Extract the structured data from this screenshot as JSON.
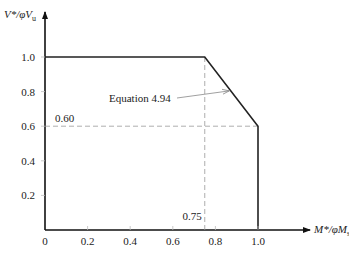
{
  "chart_data": {
    "type": "line",
    "title": "",
    "xlabel": "M*/φMₛ",
    "ylabel": "V*/φVᵤ",
    "xlabel_parts": {
      "main": "M*/φM",
      "sub": "s"
    },
    "ylabel_parts": {
      "main": "V*/φV",
      "sub": "u"
    },
    "xlim": [
      0,
      1.0
    ],
    "ylim": [
      0,
      1.0
    ],
    "grid": false,
    "x_ticks": [
      0.2,
      0.4,
      0.6,
      0.8,
      1.0
    ],
    "x_tick_labels": [
      "0",
      "0.2",
      "0.4",
      "0.6",
      "0.8",
      "1.0"
    ],
    "y_ticks": [
      0.2,
      0.4,
      0.6,
      0.8,
      1.0
    ],
    "y_tick_labels": [
      "0.2",
      "0.4",
      "0.6",
      "0.8",
      "1.0"
    ],
    "series": [
      {
        "name": "interaction boundary",
        "x": [
          0,
          0.75,
          1.0,
          1.0
        ],
        "y": [
          1.0,
          1.0,
          0.6,
          0
        ]
      }
    ],
    "reference_lines": [
      {
        "name": "vertical-0.75",
        "x": [
          0.75,
          0.75
        ],
        "y": [
          0,
          1.0
        ],
        "label": "0.75",
        "style": "dashed"
      },
      {
        "name": "horizontal-0.60",
        "x": [
          0,
          1.0
        ],
        "y": [
          0.6,
          0.6
        ],
        "label": "0.60",
        "style": "dashed"
      }
    ],
    "annotations": [
      {
        "text": "Equation 4.94",
        "points_to": {
          "x": 0.87,
          "y": 0.81
        }
      }
    ]
  }
}
